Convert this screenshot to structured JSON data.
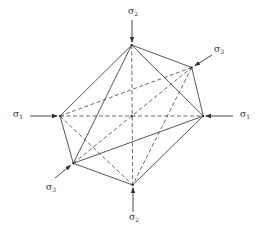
{
  "diagram": {
    "stroke_color": "#444444",
    "background": "#ffffff",
    "vertices": {
      "top": {
        "x": 131.7,
        "y": 45
      },
      "upper_right": {
        "x": 191.7,
        "y": 67.5
      },
      "right": {
        "x": 203.3,
        "y": 116
      },
      "left": {
        "x": 60,
        "y": 116
      },
      "lower_left": {
        "x": 73.3,
        "y": 163.3
      },
      "bottom": {
        "x": 132.7,
        "y": 185
      },
      "center": {
        "x": 131.7,
        "y": 116
      }
    },
    "solid_edges": [
      [
        "top",
        "left"
      ],
      [
        "top",
        "lower_left"
      ],
      [
        "top",
        "upper_right"
      ],
      [
        "top",
        "right"
      ],
      [
        "upper_right",
        "right"
      ],
      [
        "left",
        "lower_left"
      ],
      [
        "lower_left",
        "bottom"
      ],
      [
        "lower_left",
        "right"
      ],
      [
        "right",
        "bottom"
      ]
    ],
    "dashed_edges": [
      [
        "top",
        "bottom"
      ],
      [
        "left",
        "right"
      ],
      [
        "left",
        "upper_right"
      ],
      [
        "lower_left",
        "upper_right"
      ],
      [
        "upper_right",
        "bottom"
      ],
      [
        "left",
        "bottom"
      ]
    ],
    "arrows": [
      {
        "name": "sigma2-top-arrow",
        "from": [
          132,
          20
        ],
        "to": [
          132,
          42
        ]
      },
      {
        "name": "sigma3-upper-arrow",
        "from": [
          212,
          55
        ],
        "to": [
          195,
          65.5
        ]
      },
      {
        "name": "sigma1-left-arrow",
        "from": [
          30,
          116
        ],
        "to": [
          57,
          116
        ]
      },
      {
        "name": "sigma1-right-arrow",
        "from": [
          233,
          116
        ],
        "to": [
          206,
          116
        ]
      },
      {
        "name": "sigma3-lower-arrow",
        "from": [
          55,
          178
        ],
        "to": [
          70.5,
          165.5
        ]
      },
      {
        "name": "sigma2-bottom-arrow",
        "from": [
          133,
          212
        ],
        "to": [
          133,
          188
        ]
      }
    ],
    "labels": [
      {
        "name": "sigma2-top-label",
        "symbol": "σ",
        "sub": "2",
        "x": 128,
        "y": 7
      },
      {
        "name": "sigma3-upper-label",
        "symbol": "σ",
        "sub": "3",
        "x": 214,
        "y": 45
      },
      {
        "name": "sigma1-left-label",
        "symbol": "σ",
        "sub": "1",
        "x": 13,
        "y": 110
      },
      {
        "name": "sigma1-right-label",
        "symbol": "σ",
        "sub": "1",
        "x": 240,
        "y": 110
      },
      {
        "name": "sigma3-lower-label",
        "symbol": "σ",
        "sub": "3",
        "x": 46,
        "y": 183
      },
      {
        "name": "sigma2-bottom-label",
        "symbol": "σ",
        "sub": "2",
        "x": 129,
        "y": 213
      }
    ]
  }
}
